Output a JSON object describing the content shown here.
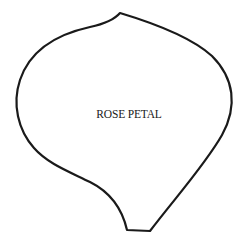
{
  "template": {
    "label": "ROSE PETAL",
    "shape": "rose-petal-outline",
    "stroke_color": "#1a1a1a",
    "fill_color": "#ffffff",
    "background_color": "#ffffff"
  }
}
